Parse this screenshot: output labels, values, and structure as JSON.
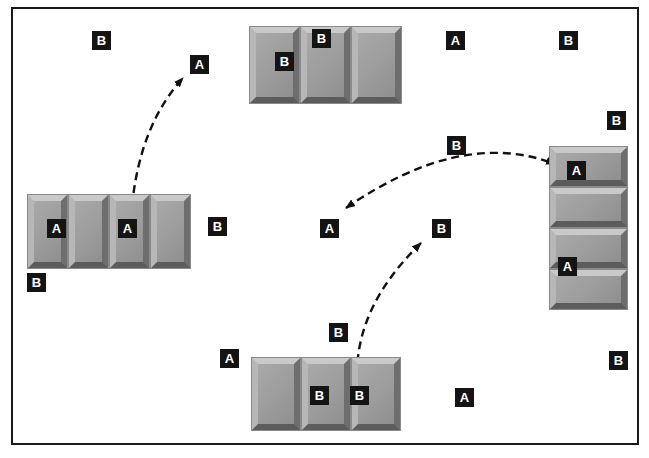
{
  "figure": {
    "colors": {
      "frame": "#1a1a1a",
      "arrow": "#111111",
      "label_bg": "#141414",
      "label_text": "#ffffff",
      "tile_face": "#9e9e9e",
      "tile_bevel_light": "#c9c9c9",
      "tile_bevel_dark": "#5c5c5c",
      "background": "#ffffff"
    },
    "frame": {
      "x": 11,
      "y": 7,
      "width": 628,
      "height": 438
    },
    "block_groups": [
      {
        "name": "top-block-group",
        "orientation": "horizontal",
        "x": 250,
        "y": 27,
        "tile_count": 3,
        "tile_width": 49,
        "tile_height": 76
      },
      {
        "name": "left-block-group",
        "orientation": "horizontal",
        "x": 28,
        "y": 195,
        "tile_count": 4,
        "tile_width": 39,
        "tile_height": 73
      },
      {
        "name": "bottom-block-group",
        "orientation": "horizontal",
        "x": 252,
        "y": 358,
        "tile_count": 3,
        "tile_width": 48,
        "tile_height": 72
      },
      {
        "name": "right-block-group",
        "orientation": "vertical",
        "x": 550,
        "y": 147,
        "tile_count": 4,
        "tile_width": 77,
        "tile_height": 39
      }
    ],
    "labels": [
      {
        "letter": "B",
        "x": 92,
        "y": 31,
        "placement": "free"
      },
      {
        "letter": "A",
        "x": 190,
        "y": 55,
        "placement": "free"
      },
      {
        "letter": "B",
        "x": 275,
        "y": 52,
        "placement": "on-top-group-tile-1"
      },
      {
        "letter": "B",
        "x": 312,
        "y": 29,
        "placement": "on-top-group-tile-2"
      },
      {
        "letter": "A",
        "x": 446,
        "y": 31,
        "placement": "free"
      },
      {
        "letter": "B",
        "x": 559,
        "y": 31,
        "placement": "free"
      },
      {
        "letter": "B",
        "x": 607,
        "y": 111,
        "placement": "free"
      },
      {
        "letter": "B",
        "x": 447,
        "y": 136,
        "placement": "free"
      },
      {
        "letter": "A",
        "x": 320,
        "y": 219,
        "placement": "free"
      },
      {
        "letter": "B",
        "x": 432,
        "y": 219,
        "placement": "free"
      },
      {
        "letter": "B",
        "x": 208,
        "y": 217,
        "placement": "free"
      },
      {
        "letter": "A",
        "x": 47,
        "y": 219,
        "placement": "on-left-group-tile-1"
      },
      {
        "letter": "A",
        "x": 118,
        "y": 219,
        "placement": "on-left-group-tile-3"
      },
      {
        "letter": "B",
        "x": 27,
        "y": 273,
        "placement": "free"
      },
      {
        "letter": "A",
        "x": 567,
        "y": 161,
        "placement": "on-right-group-tile-1"
      },
      {
        "letter": "A",
        "x": 558,
        "y": 257,
        "placement": "on-right-group-tile-3-4-boundary"
      },
      {
        "letter": "B",
        "x": 329,
        "y": 323,
        "placement": "free"
      },
      {
        "letter": "A",
        "x": 220,
        "y": 349,
        "placement": "free"
      },
      {
        "letter": "B",
        "x": 310,
        "y": 386,
        "placement": "on-bottom-group-tile-2"
      },
      {
        "letter": "B",
        "x": 350,
        "y": 386,
        "placement": "on-bottom-group-tile-3"
      },
      {
        "letter": "A",
        "x": 455,
        "y": 388,
        "placement": "free"
      },
      {
        "letter": "B",
        "x": 609,
        "y": 351,
        "placement": "free"
      }
    ],
    "arrows": [
      {
        "name": "arrow-left-group-to-a-label",
        "style": "dashed",
        "double_headed": true,
        "path": "M 132 206 Q 140 125 183 78"
      },
      {
        "name": "arrow-a-label-to-right-group",
        "style": "dashed",
        "double_headed": true,
        "path": "M 346 208 Q 462 128 555 164"
      },
      {
        "name": "arrow-b-label-to-bottom-group",
        "style": "dashed",
        "double_headed": true,
        "path": "M 421 243 Q 358 304 357 372"
      }
    ]
  }
}
